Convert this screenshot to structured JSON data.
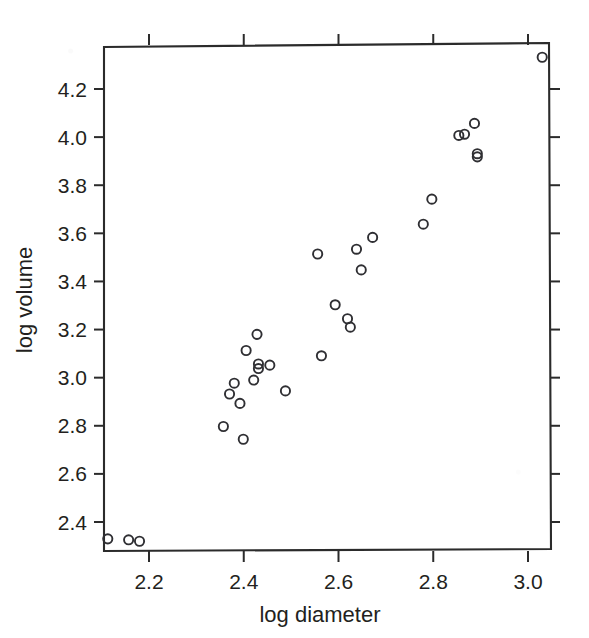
{
  "chart_data": {
    "type": "scatter",
    "title": "",
    "xlabel": "log diameter",
    "ylabel": "log volume",
    "xlim": [
      2.106,
      3.05
    ],
    "ylim": [
      2.3,
      4.348
    ],
    "grid": false,
    "legend": null,
    "marker": "open-circle",
    "marker_color": "#2f2f33",
    "background_color": "#ffffff",
    "xticks": [
      2.2,
      2.4,
      2.6,
      2.8,
      3.0
    ],
    "xtick_labels": [
      "2.2",
      "2.4",
      "2.6",
      "2.8",
      "3.0"
    ],
    "yticks": [
      2.4,
      2.6,
      2.8,
      3.0,
      3.2,
      3.4,
      3.6,
      3.8,
      4.0,
      4.2
    ],
    "ytick_labels": [
      "2.4",
      "2.6",
      "2.8",
      "3.0",
      "3.2",
      "3.4",
      "3.6",
      "3.8",
      "4.0",
      "4.2"
    ],
    "n_points": 31,
    "points": [
      {
        "x": 2.113,
        "y": 2.33
      },
      {
        "x": 2.157,
        "y": 2.326
      },
      {
        "x": 2.18,
        "y": 2.32
      },
      {
        "x": 2.357,
        "y": 2.797
      },
      {
        "x": 2.37,
        "y": 2.932
      },
      {
        "x": 2.38,
        "y": 2.977
      },
      {
        "x": 2.392,
        "y": 2.893
      },
      {
        "x": 2.399,
        "y": 2.744
      },
      {
        "x": 2.405,
        "y": 3.113
      },
      {
        "x": 2.421,
        "y": 2.99
      },
      {
        "x": 2.428,
        "y": 3.18
      },
      {
        "x": 2.431,
        "y": 3.057
      },
      {
        "x": 2.431,
        "y": 3.038
      },
      {
        "x": 2.455,
        "y": 3.052
      },
      {
        "x": 2.488,
        "y": 2.945
      },
      {
        "x": 2.556,
        "y": 3.514
      },
      {
        "x": 2.564,
        "y": 3.091
      },
      {
        "x": 2.593,
        "y": 3.303
      },
      {
        "x": 2.619,
        "y": 3.245
      },
      {
        "x": 2.625,
        "y": 3.21
      },
      {
        "x": 2.638,
        "y": 3.534
      },
      {
        "x": 2.648,
        "y": 3.448
      },
      {
        "x": 2.672,
        "y": 3.583
      },
      {
        "x": 2.779,
        "y": 3.638
      },
      {
        "x": 2.797,
        "y": 3.742
      },
      {
        "x": 2.854,
        "y": 4.007
      },
      {
        "x": 2.866,
        "y": 4.012
      },
      {
        "x": 2.887,
        "y": 4.057
      },
      {
        "x": 2.893,
        "y": 3.931
      },
      {
        "x": 2.893,
        "y": 3.918
      },
      {
        "x": 3.03,
        "y": 4.332
      }
    ]
  },
  "figure": {
    "axis_x_title": "log diameter",
    "axis_y_title": "log volume"
  }
}
